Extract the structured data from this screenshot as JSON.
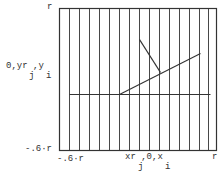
{
  "diagram": {
    "y_axis": {
      "top_label": "r",
      "mid_label": "0,yr ,y",
      "mid_sub_j": "j",
      "mid_sub_i": "i",
      "bottom_label": "-.6·r"
    },
    "x_axis": {
      "left_label": "-.6·r",
      "mid_label": "xr ,0,x",
      "mid_sub_j": "j",
      "mid_sub_i": "i",
      "right_label": "r"
    },
    "frame": {
      "x0": 59,
      "y0": 8,
      "x1": 216,
      "y1": 150
    },
    "vertical_lines_x": [
      69,
      79,
      89,
      99,
      109,
      119,
      129,
      139,
      149,
      159,
      169,
      179,
      189,
      199,
      208
    ],
    "horizontal_line": {
      "x1": 69,
      "y1": 94,
      "x2": 210,
      "y2": 94
    },
    "diagonal_line": {
      "x1": 119,
      "y1": 94,
      "x2": 200,
      "y2": 53
    },
    "short_segment": {
      "x1": 139,
      "y1": 39,
      "x2": 160,
      "y2": 72
    },
    "stroke_color": "#333333"
  }
}
